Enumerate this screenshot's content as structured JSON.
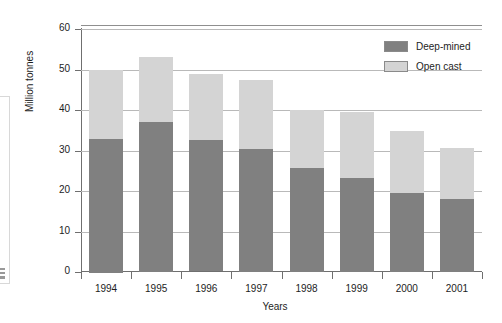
{
  "chart_data": {
    "type": "bar",
    "subtype": "stacked",
    "title": "",
    "xlabel": "Years",
    "ylabel": "Million tonnes",
    "categories": [
      "1994",
      "1995",
      "1996",
      "1997",
      "1998",
      "1999",
      "2000",
      "2001"
    ],
    "series": [
      {
        "name": "Deep-mined",
        "color": "#808080",
        "values": [
          33.0,
          37.0,
          32.4,
          30.3,
          25.6,
          23.1,
          19.6,
          18.0
        ]
      },
      {
        "name": "Open cast",
        "color": "#d4d4d4",
        "values": [
          17.0,
          16.0,
          16.4,
          17.1,
          14.4,
          16.4,
          15.2,
          12.5
        ]
      }
    ],
    "totals": [
      50.0,
      53.0,
      48.8,
      47.4,
      40.0,
      39.5,
      34.8,
      30.5
    ],
    "ylim": [
      0,
      60
    ],
    "yticks": [
      0,
      10,
      20,
      30,
      40,
      50,
      60
    ],
    "ytick_labels": [
      "0",
      "10",
      "20",
      "30",
      "40",
      "50",
      "60"
    ],
    "grid": true,
    "grid_axis": "y",
    "legend_position": "top-right"
  },
  "legend": {
    "items": [
      {
        "label": "Deep-mined",
        "color": "#808080"
      },
      {
        "label": "Open cast",
        "color": "#d4d4d4"
      }
    ]
  },
  "axes": {
    "y_title": "Million tonnes",
    "x_title": "Years"
  }
}
